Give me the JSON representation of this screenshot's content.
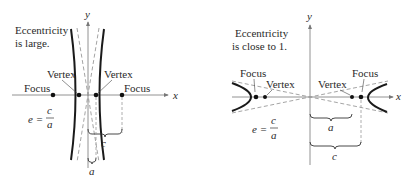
{
  "left_panel": {
    "caption_line1": "Eccentricity",
    "caption_line2": "is large.",
    "x_axis_label": "x",
    "y_axis_label": "y",
    "vertex_left_label": "Vertex",
    "vertex_right_label": "Vertex",
    "focus_left_label": "Focus",
    "focus_right_label": "Focus",
    "formula_lhs": "e =",
    "formula_num": "c",
    "formula_den": "a",
    "brace_c_label": "c",
    "brace_a_label": "a"
  },
  "right_panel": {
    "caption_line1": "Eccentricity",
    "caption_line2": "is close to 1.",
    "x_axis_label": "x",
    "y_axis_label": "y",
    "vertex_left_label": "Vertex",
    "vertex_right_label": "Vertex",
    "focus_left_label": "Focus",
    "focus_right_label": "Focus",
    "formula_lhs": "e =",
    "formula_num": "c",
    "formula_den": "a",
    "brace_a_label": "a",
    "brace_c_label": "c"
  },
  "colors": {
    "curve": "#1a1a1a",
    "axis": "#777777",
    "asymptote": "#9a9a9a",
    "background": "#ffffff"
  }
}
